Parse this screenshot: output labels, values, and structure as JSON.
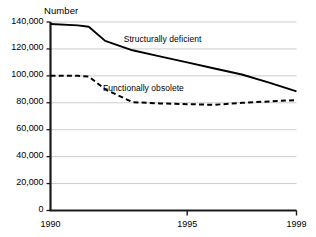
{
  "chart_data": {
    "type": "line",
    "title": "",
    "ylabel": "Number",
    "xlabel": "",
    "xlim": [
      1990,
      1999
    ],
    "ylim": [
      0,
      140000
    ],
    "grid": true,
    "legend_position": "inline-annotation",
    "y_ticks": [
      0,
      20000,
      40000,
      60000,
      80000,
      100000,
      120000,
      140000
    ],
    "y_tick_labels": [
      "0",
      "20,000",
      "40,000",
      "60,000",
      "80,000",
      "100,000",
      "120,000",
      "140,000"
    ],
    "x_ticks": [
      1990,
      1995,
      1999
    ],
    "x_tick_labels": [
      "1990",
      "1995",
      "1999"
    ],
    "series": [
      {
        "name": "Structurally deficient",
        "style": "solid",
        "color": "#000000",
        "x": [
          1990,
          1991,
          1991.4,
          1992,
          1993,
          1994,
          1995,
          1996,
          1997,
          1998,
          1999
        ],
        "values": [
          138500,
          137500,
          136500,
          126000,
          119000,
          114500,
          110000,
          105500,
          101000,
          95000,
          88500
        ]
      },
      {
        "name": "Functionally obsolete",
        "style": "dashed",
        "color": "#000000",
        "x": [
          1990,
          1991,
          1991.4,
          1992,
          1993,
          1994,
          1995,
          1996,
          1997,
          1998,
          1999
        ],
        "values": [
          100000,
          100000,
          99500,
          90000,
          80500,
          79500,
          79000,
          78500,
          80000,
          81000,
          82000
        ]
      }
    ],
    "annotations": [
      {
        "text": "Structurally deficient",
        "x": 1994.1,
        "y": 127000
      },
      {
        "text": "Functionally obsolete",
        "x": 1993.4,
        "y": 90500
      }
    ]
  },
  "axis_labels": {
    "y_axis_title": "Number"
  }
}
